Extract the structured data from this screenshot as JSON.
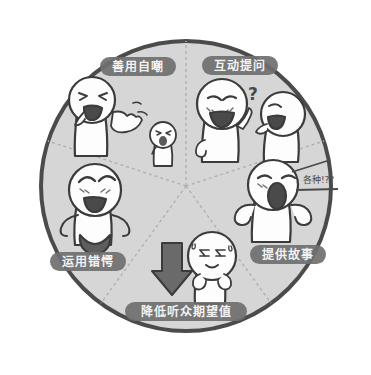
{
  "canvas": {
    "width": 371,
    "height": 375,
    "background": "#ffffff"
  },
  "diagram": {
    "title": "",
    "type": "pie-wheel",
    "center": {
      "x": 186,
      "y": 186
    },
    "radius": 147,
    "fill_color": "#d6d6d6",
    "outline_color": "#4b4b4b",
    "divider_color": "#b4b4b4",
    "label_pill_color": "#6f6f6f",
    "label_text_color": "#f2f2f2"
  },
  "segments": [
    {
      "id": "seg-top-left",
      "label": "善用自嘲",
      "label_x": 138,
      "label_y": 68,
      "label_w": 76,
      "icon": "figure-laughing-self-mockery"
    },
    {
      "id": "seg-top-right",
      "label": "互动提问",
      "label_x": 240,
      "label_y": 67,
      "label_w": 76,
      "icon": "figures-question-interaction"
    },
    {
      "id": "seg-right",
      "label": "提供故事",
      "label_x": 288,
      "label_y": 256,
      "label_w": 76,
      "icon": "figure-storytelling"
    },
    {
      "id": "seg-bottom",
      "label": "降低听众期望值",
      "label_x": 186,
      "label_y": 313,
      "label_w": 122,
      "icon": "figure-nervous-down-arrow"
    },
    {
      "id": "seg-left",
      "label": "运用错愕",
      "label_x": 88,
      "label_y": 263,
      "label_w": 76,
      "icon": "figure-confident-smile"
    }
  ],
  "annotations": {
    "question_mark": "?",
    "speech_scribble": "各种!??"
  }
}
